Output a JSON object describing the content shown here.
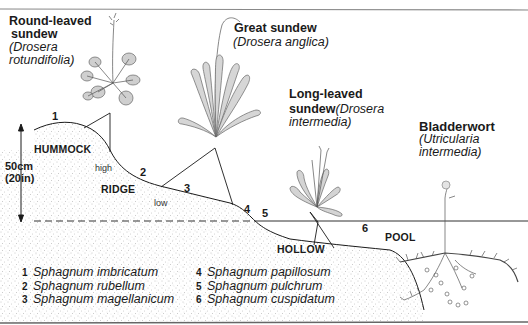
{
  "diagram": {
    "type": "bog cross-section illustration",
    "plants": [
      {
        "common": "Round-leaved sundew",
        "common_line1": "Round-leaved",
        "common_line2": "sundew",
        "latin_line1": "(Drosera",
        "latin_line2": "rotundifolia)",
        "points_to": "HUMMOCK"
      },
      {
        "common": "Great sundew",
        "latin": "(Drosera anglica)",
        "points_to": "RIDGE"
      },
      {
        "common": "Long-leaved sundew",
        "common_line1": "Long-leaved",
        "common_line2": "sundew",
        "latin_line2_inline": "(Drosera",
        "latin_line3": "intermedia)",
        "points_to": "HOLLOW"
      },
      {
        "common": "Bladderwort",
        "latin_line1": "(Utricularia",
        "latin_line2": "intermedia)",
        "points_to": "POOL"
      }
    ],
    "zones": {
      "hummock": "HUMMOCK",
      "ridge": "RIDGE",
      "hollow": "HOLLOW",
      "pool": "POOL",
      "high": "high",
      "low": "low"
    },
    "scale": {
      "line1": "50cm",
      "line2": "(20in)"
    },
    "markers": [
      "1",
      "2",
      "3",
      "4",
      "5",
      "6"
    ],
    "legend": [
      {
        "num": "1",
        "species": "Sphagnum imbricatum"
      },
      {
        "num": "2",
        "species": "Sphagnum rubellum"
      },
      {
        "num": "3",
        "species": "Sphagnum magellanicum"
      },
      {
        "num": "4",
        "species": "Sphagnum papillosum"
      },
      {
        "num": "5",
        "species": "Sphagnum pulchrum"
      },
      {
        "num": "6",
        "species": "Sphagnum cuspidatum"
      }
    ],
    "colors": {
      "ink": "#1a1a1a",
      "stipple": "#8a8a8a",
      "plant": "#555555",
      "border": "#777777"
    }
  }
}
